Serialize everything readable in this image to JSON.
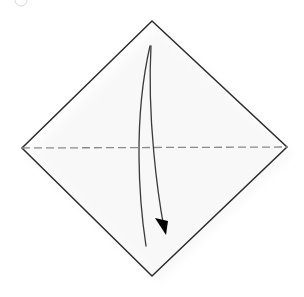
{
  "figure": {
    "background_color": "#ffffff",
    "width": 304,
    "height": 297
  },
  "colors": {
    "paper_edge": "#2b2b2b",
    "fold_line": "#8a8a8a",
    "arrow_line": "#3a3a3a",
    "arrow_head": "#000000",
    "shadow": "#f2f2f2",
    "step_marker": "#d8d8d8"
  },
  "shapes": {
    "paper": {
      "name": "square-sheet-rotated-45",
      "kind": "diamond",
      "vertices": [
        {
          "label": "top",
          "x": 152,
          "y": 21
        },
        {
          "label": "right",
          "x": 287,
          "y": 147
        },
        {
          "label": "bottom",
          "x": 152,
          "y": 276
        },
        {
          "label": "left",
          "x": 22,
          "y": 148
        }
      ],
      "stroke_width": 1.5,
      "fill": "none"
    },
    "fold_line": {
      "name": "horizontal-valley-fold-crease",
      "kind": "dashed-line",
      "from": {
        "x": 22,
        "y": 148
      },
      "to": {
        "x": 287,
        "y": 147
      },
      "dash": "8 4",
      "stroke_width": 1.3
    },
    "fold_arrow": {
      "name": "curved-fold-direction-arrow",
      "kind": "double-curve-arrow",
      "stroke_width": 1.3,
      "outer_curve": {
        "start": {
          "x": 150,
          "y": 46
        },
        "control1": {
          "x": 133,
          "y": 120
        },
        "control2": {
          "x": 139,
          "y": 200
        },
        "end": {
          "x": 146,
          "y": 246
        }
      },
      "inner_curve": {
        "start": {
          "x": 151,
          "y": 46
        },
        "control1": {
          "x": 147,
          "y": 118
        },
        "control2": {
          "x": 158,
          "y": 196
        },
        "end": {
          "x": 164,
          "y": 228
        }
      },
      "arrow_head": {
        "tip": {
          "x": 166,
          "y": 235
        },
        "base_left": {
          "x": 155,
          "y": 218
        },
        "base_right": {
          "x": 168,
          "y": 221
        }
      }
    },
    "shadow": {
      "name": "paper-drop-shadow",
      "kind": "soft-shadow",
      "opacity": 0.5
    },
    "step_marker": {
      "name": "step-number-circle-partial",
      "kind": "circle-outline",
      "center": {
        "x": 21,
        "y": 0
      },
      "radius": 6,
      "note": "faint partial circle clipped at top edge"
    }
  },
  "accessibility": {
    "figure_alt": "A square sheet of paper shown as a diamond with a horizontal dashed crease line across the middle and a curved arrow from the top point sweeping downward, indicating a valley fold."
  }
}
